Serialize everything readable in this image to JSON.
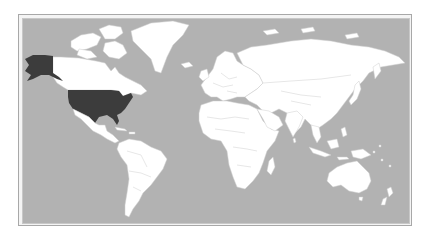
{
  "map": {
    "type": "world choropleth",
    "projection": "equirectangular-like",
    "colors": {
      "ocean": "#b2b2b2",
      "land": "#ffffff",
      "highlight": "#3c3c3c",
      "frame": "#a8a8a8",
      "country_border": "#cfcfcf"
    },
    "highlighted_regions": [
      {
        "name": "United States (contiguous)",
        "color": "#3c3c3c"
      },
      {
        "name": "Alaska",
        "color": "#3c3c3c"
      }
    ],
    "legend": null
  }
}
